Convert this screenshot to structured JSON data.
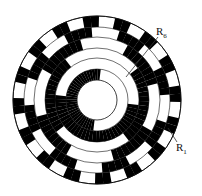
{
  "diagram": {
    "type": "gray-code-encoder-disc",
    "center": [
      97,
      100
    ],
    "hole_radius": 20,
    "track_radii": [
      20,
      31,
      42,
      52,
      63,
      73,
      84
    ],
    "bits": 6,
    "colors": {
      "on": "#000000",
      "off": "#ffffff",
      "stroke": "#111111"
    },
    "labels": [
      {
        "id": "R6",
        "text": "R",
        "sub": "6",
        "x": 156,
        "y": 27
      },
      {
        "id": "R1",
        "text": "R",
        "sub": "1",
        "x": 176,
        "y": 143
      }
    ],
    "leaders": [
      {
        "id": "R6",
        "x1": 158,
        "y1": 37,
        "x2": 126,
        "y2": 77
      },
      {
        "id": "R1",
        "x1": 177,
        "y1": 142,
        "x2": 168,
        "y2": 128
      }
    ]
  }
}
